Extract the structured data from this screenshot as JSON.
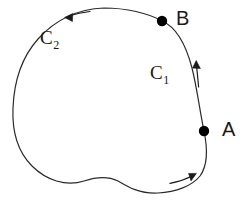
{
  "figure": {
    "background_color": "#ffffff",
    "stroke_color": "#2b2b2b",
    "point_color": "#000000",
    "stroke_width": 1.2,
    "width": 250,
    "height": 201,
    "labels": {
      "arc_c1": "C",
      "arc_c1_subscript": "1",
      "arc_c2": "C",
      "arc_c2_subscript": "2",
      "point_a": "A",
      "point_b": "B"
    },
    "points": [
      {
        "name": "A",
        "x": 204,
        "y": 131,
        "radius": 5.2
      },
      {
        "name": "B",
        "x": 162,
        "y": 21,
        "radius": 5.2
      }
    ],
    "label_positions": {
      "arc_c1": {
        "x": 150,
        "y": 63
      },
      "arc_c2": {
        "x": 40,
        "y": 28
      },
      "point_a": {
        "x": 222,
        "y": 119
      },
      "point_b": {
        "x": 176,
        "y": 8
      }
    },
    "curves": {
      "outline_path": "M 162 21 C 176 27 186 45 192 68 C 197 88 200 112 204 131 C 208 150 208 165 200 176 C 192 186 176 192 158 193 C 140 194 128 187 118 181 C 108 176 96 177 84 181 C 66 187 46 180 32 166 C 18 152 12 131 13 108 C 14 82 22 57 38 39 C 56 19 78 9 104 8 C 126 8 148 13 162 21 Z",
      "description": "Single closed loop; C1 is the short right-hand arc from B down to A, C2 is the long arc from A around the left back to B"
    },
    "arrows": [
      {
        "name": "c1-direction-arrow",
        "direction": "up",
        "description": "upward arrow alongside the C1 arc indicating travel from A to B",
        "shaft": {
          "x1": 198,
          "y1": 86,
          "x2": 196,
          "y2": 66
        },
        "head": {
          "x": 196,
          "y": 62
        }
      },
      {
        "name": "c2-top-direction-arrow",
        "direction": "left",
        "description": "leftward arrow on the upper-left arc indicating counterclockwise travel of C2",
        "shaft": {
          "x1": 88,
          "y1": 12,
          "x2": 70,
          "y2": 16
        },
        "head": {
          "x": 66,
          "y": 17
        }
      },
      {
        "name": "c2-bottom-direction-arrow",
        "direction": "right",
        "description": "rightward arrow on the lower-right arc indicating travel toward A",
        "shaft": {
          "x1": 172,
          "y1": 182,
          "x2": 192,
          "y2": 175
        },
        "head": {
          "x": 196,
          "y": 173
        }
      }
    ]
  }
}
